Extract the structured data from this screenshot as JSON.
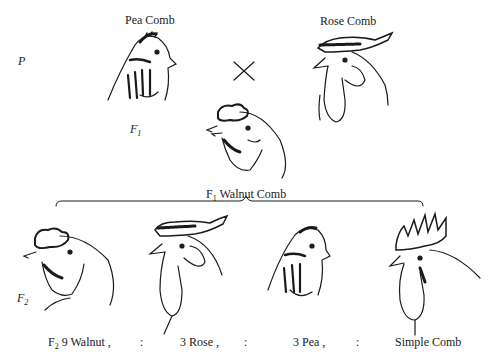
{
  "generations": {
    "parental": {
      "label": "P"
    },
    "f1": {
      "label": "F",
      "sub": "1"
    },
    "f2": {
      "label": "F",
      "sub": "2"
    }
  },
  "parents": [
    {
      "name": "Pea Comb",
      "comb_type": "pea"
    },
    {
      "name": "Rose Comb",
      "comb_type": "rose"
    }
  ],
  "cross_symbol": "×",
  "f1_offspring": {
    "prefix": "F",
    "sub": "1",
    "label": "Walnut Comb",
    "comb_type": "walnut"
  },
  "f2_ratio": {
    "prefix": "F",
    "sub": "2",
    "items": [
      {
        "count": "9",
        "label": "9 Walnut ,",
        "comb_type": "walnut"
      },
      {
        "count": "3",
        "label": "3 Rose ,",
        "comb_type": "rose"
      },
      {
        "count": "3",
        "label": "3 Pea ,",
        "comb_type": "pea"
      },
      {
        "count": "1",
        "label": "Simple Comb",
        "comb_type": "single"
      }
    ],
    "separator": ":"
  },
  "colors": {
    "ink": "#1a1a1a",
    "background": "#ffffff"
  }
}
